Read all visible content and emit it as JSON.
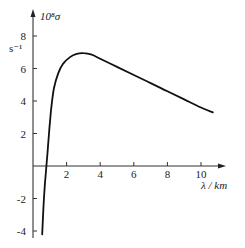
{
  "chart_data": {
    "type": "line",
    "title": "",
    "xlabel": "λ / km",
    "ylabel": "10⁸σ",
    "yunit": "s⁻¹",
    "xlim": [
      0,
      11
    ],
    "ylim": [
      -4.5,
      9
    ],
    "x_ticks": [
      2,
      4,
      6,
      8,
      10
    ],
    "y_ticks": [
      -4,
      -2,
      2,
      4,
      6,
      8
    ],
    "grid": false,
    "legend": null,
    "series": [
      {
        "name": "σ(λ)",
        "x": [
          0.55,
          0.62,
          0.7,
          0.8,
          0.9,
          1.0,
          1.1,
          1.25,
          1.5,
          1.8,
          2.2,
          2.6,
          3.0,
          3.5,
          4.0,
          5.0,
          6.0,
          7.0,
          8.0,
          9.0,
          10.0,
          10.7
        ],
        "y": [
          -4.2,
          -2.6,
          -1.2,
          0.0,
          1.3,
          2.6,
          3.7,
          4.8,
          5.7,
          6.3,
          6.7,
          6.9,
          6.95,
          6.85,
          6.6,
          6.1,
          5.6,
          5.1,
          4.6,
          4.1,
          3.6,
          3.3
        ]
      }
    ]
  },
  "axes": {
    "y_label": "10⁸σ",
    "y_unit": "s⁻¹",
    "x_label": "λ / km",
    "x_tick_labels": [
      "2",
      "4",
      "6",
      "8",
      "10"
    ],
    "y_tick_labels": [
      "8",
      "6",
      "4",
      "2",
      "-2",
      "-4"
    ]
  }
}
